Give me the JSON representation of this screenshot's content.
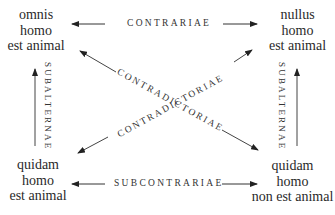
{
  "diagram": {
    "corners": {
      "top_left": {
        "lines": [
          "omnis",
          "homo",
          "est animal"
        ]
      },
      "top_right": {
        "lines": [
          "nullus",
          "homo",
          "est animal"
        ]
      },
      "bottom_left": {
        "lines": [
          "quidam",
          "homo",
          "est animal"
        ]
      },
      "bottom_right": {
        "lines": [
          "quidam",
          "homo",
          "non est animal"
        ]
      }
    },
    "relations": {
      "top": "CONTRARIAE",
      "bottom": "SUBCONTRARIAE",
      "left": "SUBALTERNAE",
      "right": "SUBALTERNAE",
      "diagonal_down": "CONTRADICTORIAE",
      "diagonal_up": "CONTRADICTORIAE"
    },
    "colors": {
      "text": "#2a2a2a",
      "line": "#333333",
      "background": "#ffffff"
    },
    "icons": {
      "arrow_head": "arrow-icon"
    }
  }
}
